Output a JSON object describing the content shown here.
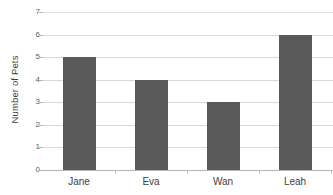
{
  "chart_data": {
    "type": "bar",
    "title": "",
    "xlabel": "",
    "ylabel": "Number of Pets",
    "categories": [
      "Jane",
      "Eva",
      "Wan",
      "Leah"
    ],
    "values": [
      5,
      4,
      3,
      6
    ],
    "ylim": [
      0,
      7
    ],
    "yticks": [
      0,
      1,
      2,
      3,
      4,
      5,
      6,
      7
    ],
    "ytick_labels": [
      "0",
      "1",
      "2",
      "3",
      "4",
      "5",
      "6",
      "7"
    ],
    "grid": "horizontal",
    "legend": "none",
    "bar_color": "#595959",
    "gridline_color": "#d9d9d9",
    "axis_color": "#b5b5b5",
    "note_cropped_right": true
  }
}
